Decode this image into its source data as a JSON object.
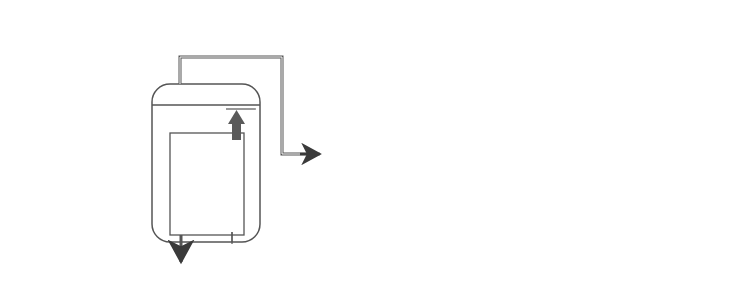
{
  "diagram": {
    "type": "triple-effect evaporator flow diagram",
    "colors": {
      "line": "#555555",
      "arrow": "#3a3a3a",
      "tube_arrow": "#5a5a5a",
      "text": "#333333"
    },
    "vapor_labels": [
      {
        "main": "V",
        "sub": "1",
        "open": "(",
        "t": "T",
        "tsub": "B1",
        "close": ")"
      },
      {
        "main": "V",
        "sub": "2",
        "open": "(",
        "t": "T",
        "tsub": "B2",
        "close": ")"
      },
      {
        "main": "V",
        "sub": "3",
        "open": "(",
        "t": "T",
        "tsub": "B3",
        "close": ")"
      }
    ],
    "effects": [
      {
        "pressure": "P",
        "psub": "1",
        "boil": "T",
        "boilsub": "B1",
        "heat": "T",
        "heatsub": "S"
      },
      {
        "pressure": "P",
        "psub": "2",
        "boil": "T",
        "boilsub": "B2",
        "heat": "T",
        "heatsub": "B1"
      },
      {
        "pressure": "P",
        "psub": "3",
        "boil": "T",
        "boilsub": "B3",
        "heat": "T",
        "heatsub": "B2"
      }
    ],
    "liquor_labels": [
      {
        "main": "W",
        "sub": "1",
        "x": "x",
        "xsub": "1",
        "t": "T",
        "tsub": "B1"
      },
      {
        "main": "W",
        "sub": "2",
        "x": "x",
        "xsub": "2",
        "t": "T",
        "tsub": "B2"
      },
      {
        "main": "W",
        "sub": "3",
        "x": "x",
        "xsub": "3",
        "t": "T",
        "tsub": "B3"
      }
    ],
    "feed": {
      "jp": "供給液",
      "main": "F",
      "x": "x",
      "xsub": "F",
      "t": "T",
      "tsub": "F"
    },
    "steam": {
      "jp": "加熱用蒸気"
    },
    "condenser": {
      "label": "凝縮器",
      "noncondensable": "非凝縮性気体",
      "cooling_water": "冷却水",
      "cooling_temp": "T",
      "cooling_temp_sub": "W",
      "condensate": "凝縮水"
    },
    "caption": "（図キャプション：判読不能）"
  }
}
